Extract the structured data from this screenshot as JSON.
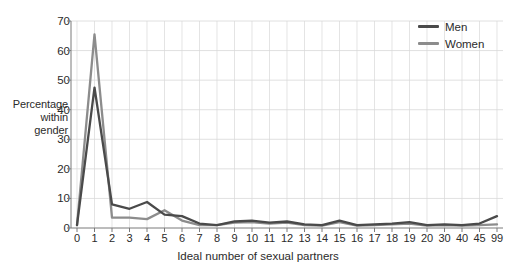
{
  "chart_data": {
    "type": "line",
    "title": "",
    "xlabel": "Ideal number of sexual partners",
    "ylabel": "Percentage within gender",
    "ylabel_lines": [
      "Percentage",
      "within",
      "gender"
    ],
    "categories": [
      "0",
      "1",
      "2",
      "3",
      "4",
      "5",
      "6",
      "7",
      "8",
      "9",
      "10",
      "11",
      "12",
      "13",
      "14",
      "15",
      "16",
      "17",
      "18",
      "19",
      "20",
      "30",
      "40",
      "45",
      "99"
    ],
    "yticks": [
      0,
      10,
      20,
      30,
      40,
      50,
      60,
      70
    ],
    "ylim": [
      0,
      70
    ],
    "grid": true,
    "legend_position": "top-right",
    "series": [
      {
        "name": "Men",
        "color": "#4a4a4a",
        "values": [
          1.0,
          47.5,
          8.0,
          6.5,
          8.8,
          4.5,
          4.0,
          1.5,
          1.0,
          2.2,
          2.5,
          1.8,
          2.2,
          1.2,
          1.0,
          2.5,
          1.0,
          1.2,
          1.5,
          2.0,
          1.0,
          1.2,
          1.0,
          1.5,
          4.0
        ]
      },
      {
        "name": "Women",
        "color": "#8c8c8c",
        "values": [
          1.0,
          65.5,
          3.5,
          3.5,
          3.0,
          6.0,
          2.5,
          1.0,
          1.0,
          1.8,
          2.0,
          1.5,
          1.8,
          1.0,
          0.8,
          2.0,
          0.8,
          1.0,
          1.2,
          1.5,
          0.8,
          1.0,
          0.8,
          1.0,
          1.2
        ]
      }
    ]
  },
  "legend": {
    "items": [
      {
        "label": "Men",
        "color": "#4a4a4a"
      },
      {
        "label": "Women",
        "color": "#8c8c8c"
      }
    ]
  },
  "colors": {
    "men": "#4a4a4a",
    "women": "#8c8c8c",
    "axis": "#7a7a7a",
    "grid": "#d8d8d8",
    "text": "#2b2b2b",
    "background": "#ffffff"
  }
}
